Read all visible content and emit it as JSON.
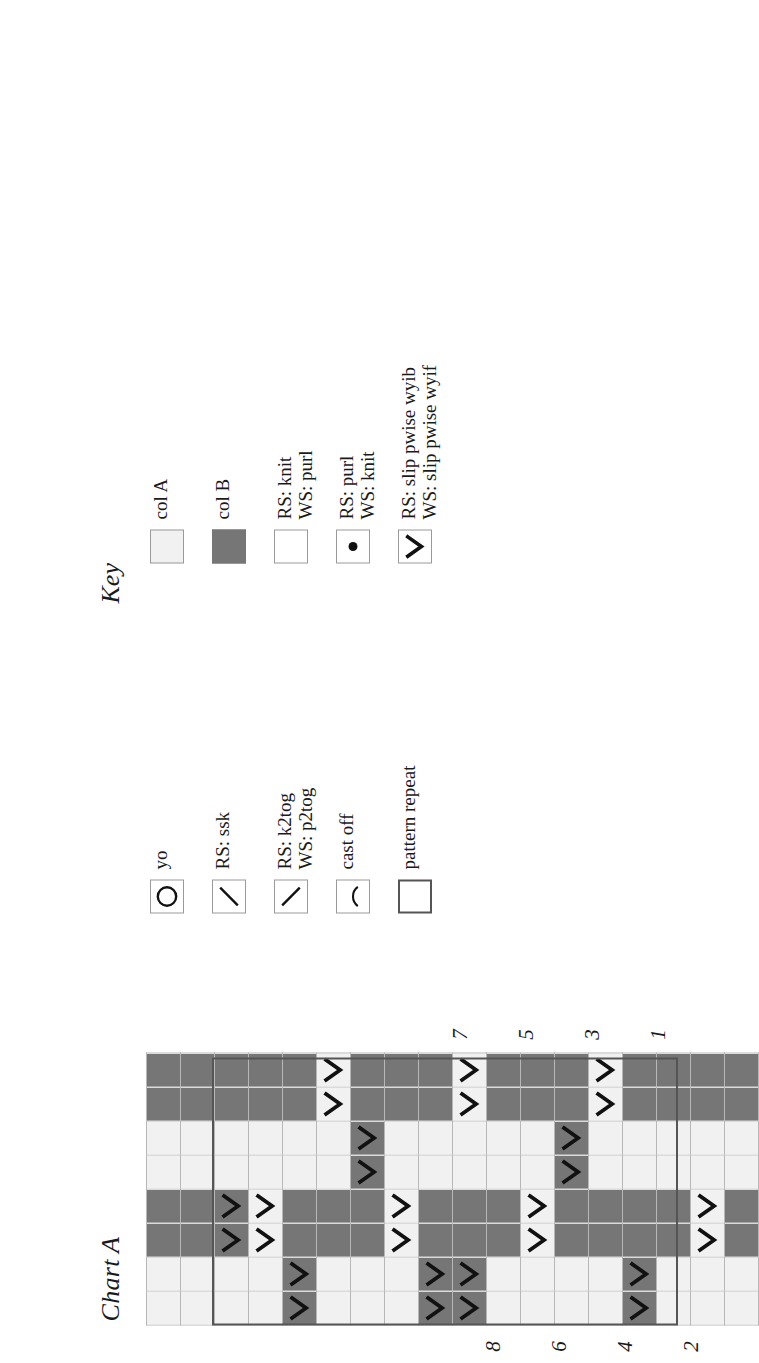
{
  "chart": {
    "title": "Chart A",
    "columns": 8,
    "rows": 18,
    "row_numbers_odd": [
      "1",
      "3",
      "5",
      "7"
    ],
    "row_numbers_even": [
      "2",
      "4",
      "6",
      "8"
    ],
    "colors": {
      "col_a": "#f1f1f1",
      "col_b": "#767676",
      "grid_line": "#b7b7b7",
      "repeat_outline": "#555555",
      "symbol": "#111111"
    }
  },
  "chart_data": {
    "type": "heatmap",
    "title": "Chart A",
    "xlabel": "",
    "ylabel": "",
    "legend": "Key",
    "grid": true,
    "columns": 8,
    "rows": 18,
    "cell_codes": "A = col A (light), B = col B (dark), > = slip pwise chevron symbol overlaid",
    "row_labels_visible": [
      "1",
      "2",
      "3",
      "4",
      "5",
      "6",
      "7",
      "8"
    ],
    "cells": [
      [
        "A",
        "A",
        "B",
        "B",
        "A",
        "A",
        "B",
        "B"
      ],
      [
        "A",
        "A",
        "B",
        "B",
        "A",
        "A",
        "B",
        "B"
      ],
      [
        "A",
        "A",
        "B>",
        "B>",
        "A",
        "A",
        "B",
        "B"
      ],
      [
        "A",
        "A",
        "A>",
        "A>",
        "A",
        "A",
        "B",
        "B"
      ],
      [
        "B>",
        "B>",
        "B",
        "B",
        "A",
        "A",
        "B",
        "B"
      ],
      [
        "A",
        "A",
        "B",
        "B",
        "A",
        "A",
        "A>",
        "A>"
      ],
      [
        "A",
        "A",
        "B",
        "B",
        "B>",
        "B>",
        "B",
        "B"
      ],
      [
        "A",
        "A",
        "A>",
        "A>",
        "A",
        "A",
        "B",
        "B"
      ],
      [
        "B>",
        "B>",
        "B",
        "B",
        "A",
        "A",
        "B",
        "B"
      ],
      [
        "B>",
        "B>",
        "B",
        "B",
        "A",
        "A",
        "A>",
        "A>"
      ],
      [
        "A",
        "A",
        "B",
        "B",
        "A",
        "A",
        "B",
        "B"
      ],
      [
        "A",
        "A",
        "A>",
        "A>",
        "A",
        "A",
        "B",
        "B"
      ],
      [
        "A",
        "A",
        "B",
        "B",
        "B>",
        "B>",
        "B",
        "B"
      ],
      [
        "A",
        "A",
        "B",
        "B",
        "A",
        "A",
        "A>",
        "A>"
      ],
      [
        "B>",
        "B>",
        "B",
        "B",
        "A",
        "A",
        "B",
        "B"
      ],
      [
        "A",
        "A",
        "B",
        "B",
        "A",
        "A",
        "B",
        "B"
      ],
      [
        "A",
        "A",
        "A>",
        "A>",
        "A",
        "A",
        "B",
        "B"
      ],
      [
        "A",
        "A",
        "B",
        "B",
        "A",
        "A",
        "B",
        "B"
      ]
    ]
  },
  "key": {
    "title": "Key",
    "column_right": [
      {
        "symbol": "swatch-col-a",
        "labels": [
          "col A"
        ]
      },
      {
        "symbol": "swatch-col-b",
        "labels": [
          "col B"
        ]
      },
      {
        "symbol": "blank-square",
        "labels": [
          "RS: knit",
          "WS: purl"
        ]
      },
      {
        "symbol": "dot-square",
        "labels": [
          "RS: purl",
          "WS: knit"
        ]
      },
      {
        "symbol": "chevron-square",
        "labels": [
          "RS: slip pwise wyib",
          "WS: slip pwise wyif"
        ]
      }
    ],
    "column_left": [
      {
        "symbol": "circle-square",
        "labels": [
          "yo"
        ]
      },
      {
        "symbol": "slash-up-square",
        "labels": [
          "RS: ssk"
        ]
      },
      {
        "symbol": "slash-down-square",
        "labels": [
          "RS: k2tog",
          "WS: p2tog"
        ]
      },
      {
        "symbol": "arc-square",
        "labels": [
          "cast off"
        ]
      },
      {
        "symbol": "thick-square",
        "labels": [
          "pattern repeat"
        ]
      }
    ]
  }
}
